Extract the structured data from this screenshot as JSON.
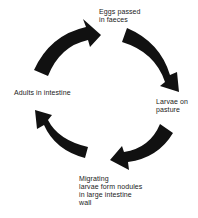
{
  "diagram": {
    "type": "life-cycle",
    "stages": [
      {
        "id": "eggs",
        "label": "Eggs passed\nin faeces"
      },
      {
        "id": "larvae",
        "label": "Larvae on\npasture"
      },
      {
        "id": "migrating",
        "label": "Migrating\nlarvae form nodules\nin large intestine\nwall"
      },
      {
        "id": "adults",
        "label": "Adults in intestine"
      }
    ],
    "arrows": [
      {
        "from": "adults",
        "to": "eggs",
        "icon": "curved-arrow-icon"
      },
      {
        "from": "eggs",
        "to": "larvae",
        "icon": "curved-arrow-icon"
      },
      {
        "from": "larvae",
        "to": "migrating",
        "icon": "curved-arrow-icon"
      },
      {
        "from": "migrating",
        "to": "adults",
        "icon": "curved-arrow-icon"
      }
    ],
    "colors": {
      "arrow": "#111111",
      "text": "#1a1a1a",
      "background": "#ffffff"
    }
  }
}
